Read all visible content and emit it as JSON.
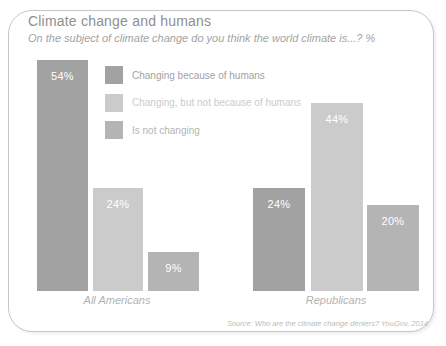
{
  "header": {
    "title": "Climate change and humans",
    "subtitle": "On the subject of climate change do you think the world climate is...? %"
  },
  "colors": {
    "human_caused": "#a2a2a2",
    "not_human_caused": "#cbcbcb",
    "not_changing": "#b4b4b4",
    "border": "#c6c6c6",
    "title_text": "#8f8f8f",
    "value_label_text": "#ffffff"
  },
  "chart_data": {
    "type": "bar",
    "title": "Climate change and humans",
    "subtitle": "On the subject of climate change do you think the world climate is...? %",
    "categories": [
      "All Americans",
      "Republicans"
    ],
    "series": [
      {
        "name": "Changing because of humans",
        "values": [
          54,
          24
        ],
        "color": "#a2a2a2"
      },
      {
        "name": "Changing, but not because of humans",
        "values": [
          24,
          44
        ],
        "color": "#cbcbcb"
      },
      {
        "name": "Is not changing",
        "values": [
          9,
          20
        ],
        "color": "#b4b4b4"
      }
    ],
    "value_label_suffix": "%",
    "ylim": [
      0,
      54
    ],
    "grid": false,
    "axes_shown": false,
    "legend_position": "inside-top-left",
    "xlabel": "",
    "ylabel": ""
  },
  "footer": {
    "source": "Source: Who are the climate change deniers? YouGov, 2014"
  }
}
